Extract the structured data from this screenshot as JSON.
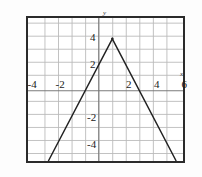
{
  "chart_data": {
    "type": "line",
    "title": "",
    "xlabel": "x",
    "ylabel": "y",
    "xlim": [
      -5.2,
      6.2
    ],
    "ylim": [
      -5.4,
      5.6
    ],
    "grid": true,
    "grid_step": 1,
    "legend": "none",
    "x_tick_labels": [
      "-4",
      "-2",
      "2",
      "4",
      "6"
    ],
    "x_tick_values": [
      -4,
      -2,
      2,
      4,
      6
    ],
    "y_tick_labels": [
      "4",
      "2",
      "-2",
      "-4"
    ],
    "y_tick_values": [
      4,
      2,
      -2,
      -4
    ],
    "series": [
      {
        "name": "y = 4 - 2|x - 1|",
        "color": "#222222",
        "vertex": [
          1,
          4
        ],
        "slope_left": 2,
        "slope_right": -2,
        "points": [
          [
            -3.7,
            -5.4
          ],
          [
            1,
            4
          ],
          [
            5.7,
            -5.4
          ]
        ]
      }
    ],
    "annotations": []
  },
  "axes": {
    "x_axis_label": "x",
    "y_axis_label": "y"
  },
  "ticks": {
    "x": [
      {
        "label": "-4",
        "value": -4
      },
      {
        "label": "-2",
        "value": -2
      },
      {
        "label": "2",
        "value": 2
      },
      {
        "label": "4",
        "value": 4
      },
      {
        "label": "6",
        "value": 6
      }
    ],
    "y": [
      {
        "label": "4",
        "value": 4
      },
      {
        "label": "2",
        "value": 2
      },
      {
        "label": "-2",
        "value": -2
      },
      {
        "label": "-4",
        "value": -4
      }
    ]
  },
  "colors": {
    "curve": "#222222",
    "grid": "#b9b9b9",
    "axis": "#555555",
    "frame": "#2b2b2b",
    "background": "#ffffff"
  }
}
